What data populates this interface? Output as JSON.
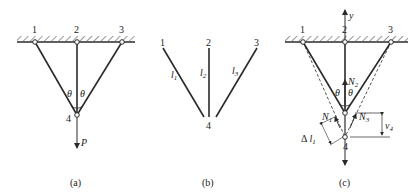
{
  "panels": {
    "a": {
      "caption": "(a)",
      "nodes": [
        "1",
        "2",
        "3",
        "4"
      ],
      "angle_left": "θ",
      "angle_right": "θ",
      "load": "P"
    },
    "b": {
      "caption": "(b)",
      "nodes": [
        "1",
        "2",
        "3",
        "4"
      ],
      "bars": [
        {
          "name": "l",
          "sub": "1"
        },
        {
          "name": "l",
          "sub": "2"
        },
        {
          "name": "l",
          "sub": "3"
        }
      ]
    },
    "c": {
      "caption": "(c)",
      "nodes": [
        "1",
        "2",
        "3",
        "4"
      ],
      "axis": "y",
      "angle_left": "θ",
      "angle_right": "θ",
      "forces": [
        {
          "name": "N",
          "sub": "1"
        },
        {
          "name": "N",
          "sub": "2"
        },
        {
          "name": "N",
          "sub": "3"
        }
      ],
      "elongation": {
        "prefix": "Δ ",
        "name": "l",
        "sub": "1"
      },
      "displacement": {
        "name": "v",
        "sub": "4"
      }
    }
  },
  "colors": {
    "stroke": "#2a2a2a",
    "background": "#ffffff"
  }
}
